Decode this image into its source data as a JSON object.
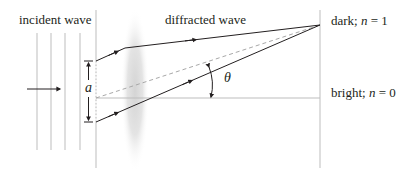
{
  "labels": {
    "incident": "incident wave",
    "diffracted": "diffracted wave",
    "dark_prefix": "dark; ",
    "dark_var": "n",
    "dark_suffix": " = 1",
    "bright_prefix": "bright; ",
    "bright_var": "n",
    "bright_suffix": " = 0",
    "slit_width": "a",
    "angle": "θ"
  },
  "colors": {
    "line": "#231f20",
    "guide": "#bdbdbd",
    "dashed": "#a8a8a8",
    "lens": "#e6e6e6"
  }
}
